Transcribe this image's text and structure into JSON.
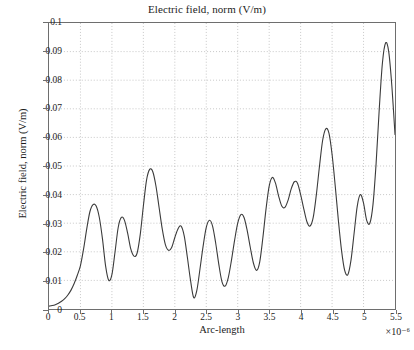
{
  "chart_data": {
    "type": "line",
    "title": "Electric field, norm (V/m)",
    "xlabel": "Arc-length",
    "ylabel": "Electric field, norm (V/m)",
    "x_multiplier": "×10⁻⁶",
    "xlim": [
      0,
      5.5
    ],
    "ylim": [
      0,
      0.1
    ],
    "grid": true,
    "legend": null,
    "xticks": [
      "0",
      "0.5",
      "1",
      "1.5",
      "2",
      "2.5",
      "3",
      "3.5",
      "4",
      "4.5",
      "5",
      "5.5"
    ],
    "xtick_values": [
      0,
      0.5,
      1,
      1.5,
      2,
      2.5,
      3,
      3.5,
      4,
      4.5,
      5,
      5.5
    ],
    "yticks": [
      "0",
      "0.01",
      "0.02",
      "0.03",
      "0.04",
      "0.05",
      "0.06",
      "0.07",
      "0.08",
      "0.09",
      "0.1"
    ],
    "ytick_values": [
      0,
      0.01,
      0.02,
      0.03,
      0.04,
      0.05,
      0.06,
      0.07,
      0.08,
      0.09,
      0.1
    ],
    "line_color": "#3a3a3a",
    "series": [
      {
        "name": "Electric field norm",
        "x": [
          0.0,
          0.05,
          0.1,
          0.15,
          0.2,
          0.25,
          0.3,
          0.35,
          0.4,
          0.45,
          0.5,
          0.55,
          0.6,
          0.65,
          0.7,
          0.75,
          0.8,
          0.85,
          0.9,
          0.95,
          1.0,
          1.05,
          1.1,
          1.15,
          1.2,
          1.25,
          1.3,
          1.35,
          1.4,
          1.45,
          1.5,
          1.55,
          1.6,
          1.65,
          1.7,
          1.75,
          1.8,
          1.85,
          1.9,
          1.95,
          2.0,
          2.05,
          2.1,
          2.15,
          2.2,
          2.25,
          2.3,
          2.35,
          2.4,
          2.45,
          2.5,
          2.55,
          2.6,
          2.65,
          2.7,
          2.75,
          2.8,
          2.85,
          2.9,
          2.95,
          3.0,
          3.05,
          3.1,
          3.15,
          3.2,
          3.25,
          3.3,
          3.35,
          3.4,
          3.45,
          3.5,
          3.55,
          3.6,
          3.65,
          3.7,
          3.75,
          3.8,
          3.85,
          3.9,
          3.95,
          4.0,
          4.05,
          4.1,
          4.15,
          4.2,
          4.25,
          4.3,
          4.35,
          4.4,
          4.45,
          4.5,
          4.55,
          4.6,
          4.65,
          4.7,
          4.75,
          4.8,
          4.85,
          4.9,
          4.95,
          5.0,
          5.05,
          5.1,
          5.15,
          5.2,
          5.25,
          5.3,
          5.35,
          5.4,
          5.45,
          5.5
        ],
        "y": [
          0.001,
          0.0012,
          0.0015,
          0.002,
          0.0027,
          0.0036,
          0.0049,
          0.0066,
          0.0089,
          0.0118,
          0.0152,
          0.021,
          0.028,
          0.034,
          0.0365,
          0.036,
          0.032,
          0.0245,
          0.015,
          0.01,
          0.012,
          0.02,
          0.0285,
          0.032,
          0.031,
          0.0265,
          0.021,
          0.0185,
          0.0195,
          0.026,
          0.036,
          0.045,
          0.0488,
          0.048,
          0.043,
          0.0355,
          0.028,
          0.0225,
          0.0205,
          0.0215,
          0.025,
          0.028,
          0.029,
          0.0255,
          0.018,
          0.01,
          0.004,
          0.0065,
          0.014,
          0.022,
          0.0285,
          0.031,
          0.029,
          0.023,
          0.0155,
          0.0095,
          0.008,
          0.011,
          0.017,
          0.024,
          0.03,
          0.033,
          0.032,
          0.0275,
          0.0215,
          0.016,
          0.0135,
          0.0165,
          0.025,
          0.035,
          0.043,
          0.046,
          0.044,
          0.0395,
          0.036,
          0.0355,
          0.038,
          0.042,
          0.0445,
          0.044,
          0.04,
          0.035,
          0.0305,
          0.029,
          0.032,
          0.04,
          0.05,
          0.059,
          0.063,
          0.0615,
          0.054,
          0.043,
          0.031,
          0.0205,
          0.0135,
          0.012,
          0.017,
          0.0265,
          0.036,
          0.04,
          0.037,
          0.031,
          0.03,
          0.0365,
          0.051,
          0.07,
          0.086,
          0.093,
          0.09,
          0.078,
          0.061
        ]
      },
      {
        "name": "tail",
        "x": [
          5.5
        ],
        "y": [
          0.061
        ]
      }
    ],
    "curve_path_note": "single continuous oscillating trace with growing amplitude toward right edge"
  },
  "axes": {
    "title": "Electric field, norm (V/m)",
    "xlabel": "Arc-length",
    "ylabel": "Electric field, norm (V/m)",
    "x_multiplier": "×10⁻⁶"
  }
}
